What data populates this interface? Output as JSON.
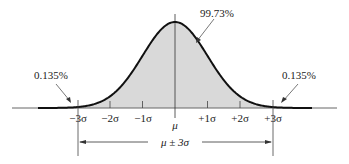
{
  "diagram": {
    "center_label": "μ",
    "tick_labels": [
      "−3σ",
      "−2σ",
      "−1σ",
      "+1σ",
      "+2σ",
      "+3σ"
    ],
    "annotations": {
      "center_area": "99.73%",
      "left_tail": "0.135%",
      "right_tail": "0.135%",
      "range": "μ ± 3σ"
    },
    "colors": {
      "curve": "#111111",
      "fill": "#d9d9d9",
      "axis": "#555555",
      "text": "#222222"
    }
  }
}
